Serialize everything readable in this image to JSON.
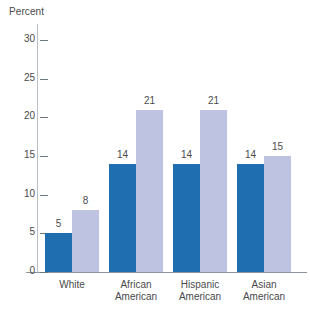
{
  "chart_data": {
    "type": "bar",
    "title": "",
    "ylabel": "Percent",
    "xlabel": "",
    "ylim": [
      0,
      30
    ],
    "yticks": [
      0,
      5,
      10,
      15,
      20,
      25,
      30
    ],
    "ytick_labels": [
      "0",
      "5",
      "10",
      "15",
      "20",
      "25",
      "30"
    ],
    "grid": false,
    "legend_position": "top-left",
    "categories": [
      "White",
      "African American",
      "Hispanic American",
      "Asian American"
    ],
    "category_lines": [
      [
        "White",
        ""
      ],
      [
        "African",
        "American"
      ],
      [
        "Hispanic",
        "American"
      ],
      [
        "Asian",
        "American"
      ]
    ],
    "series": [
      {
        "name": "Male",
        "color": "#1f6fb0",
        "values": [
          5,
          14,
          14,
          14
        ],
        "value_labels": [
          "5",
          "14",
          "14",
          "14"
        ]
      },
      {
        "name": "Female",
        "color": "#bfc3e2",
        "values": [
          8,
          21,
          21,
          15
        ],
        "value_labels": [
          "8",
          "21",
          "21",
          "15"
        ]
      }
    ]
  },
  "colors": {
    "male": "#1f6fb0",
    "female": "#bfc3e2",
    "axis": "#8d93a0",
    "text": "#4a4a4a",
    "background": "#ffffff"
  }
}
